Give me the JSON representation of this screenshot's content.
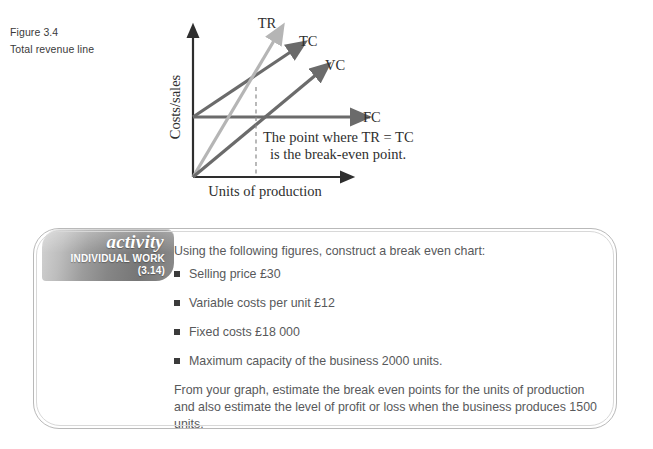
{
  "figure": {
    "number": "Figure 3.4",
    "caption": "Total revenue line"
  },
  "diagram": {
    "y_axis_label": "Costs/sales",
    "x_axis_label": "Units of production",
    "line_labels": {
      "tr": "TR",
      "tc": "TC",
      "vc": "VC",
      "fc": "FC"
    },
    "annotation_line1": "The point where TR = TC",
    "annotation_line2": "is the break-even point.",
    "colors": {
      "axis": "#2e2e2e",
      "tc_line": "#6b6b6b",
      "tr_line": "#b5b5b5",
      "vc_line": "#6b6b6b",
      "fc_line": "#6b6b6b",
      "dashed": "#8a8a8a"
    }
  },
  "activity": {
    "title": "activity",
    "kind": "INDIVIDUAL WORK",
    "number": "(3.14)",
    "intro": "Using the following figures, construct a break even chart:",
    "items": [
      "Selling price £30",
      "Variable costs per unit £12",
      "Fixed costs £18 000",
      "Maximum capacity of the business 2000 units."
    ],
    "outro": "From your graph, estimate the break even points for the units of production and also estimate the level of profit or loss when the business produces 1500 units."
  }
}
